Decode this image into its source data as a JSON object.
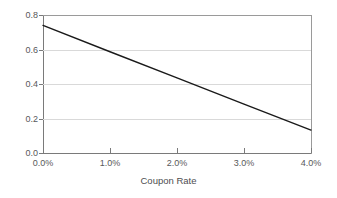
{
  "chart_data": {
    "type": "line",
    "title": "",
    "subtitle": "",
    "xlabel": "Coupon Rate",
    "ylabel": "",
    "xlim": [
      0,
      4
    ],
    "ylim": [
      0,
      0.8
    ],
    "grid": true,
    "legend": false,
    "x_tick_labels": [
      "0.0%",
      "1.0%",
      "2.0%",
      "3.0%",
      "4.0%"
    ],
    "x_tick_values": [
      0,
      1,
      2,
      3,
      4
    ],
    "y_tick_labels": [
      "0.0",
      "0.2",
      "0.4",
      "0.6",
      "0.8"
    ],
    "y_tick_values": [
      0,
      0.2,
      0.4,
      0.6,
      0.8
    ],
    "series": [
      {
        "name": "",
        "color": "#1a1a1a",
        "x": [
          0,
          1,
          2,
          3,
          4
        ],
        "values": [
          0.74,
          0.587,
          0.435,
          0.283,
          0.133
        ]
      }
    ]
  },
  "colors": {
    "background": "#ffffff",
    "grid": "#d9d9d9",
    "axis": "#7a7a7a",
    "series_line": "#1a1a1a",
    "tick_text": "#58585a",
    "axis_title_text": "#4d4d4f"
  }
}
